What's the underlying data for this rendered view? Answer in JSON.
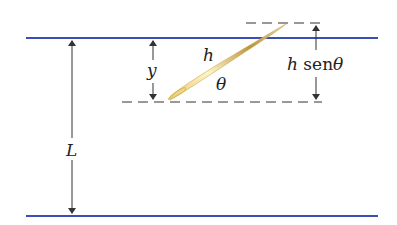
{
  "diagram": {
    "type": "buffon-needle",
    "labels": {
      "L": "L",
      "y": "y",
      "h": "h",
      "theta": "θ",
      "h_sen_theta_h": "h",
      "h_sen_theta_fn": "sen",
      "h_sen_theta_theta": "θ"
    },
    "colors": {
      "parallel_line": "#3a4fb5",
      "arrow": "#333333",
      "dash": "#333333",
      "needle_light": "#f5e6a8",
      "needle_dark": "#b08a2a"
    }
  }
}
